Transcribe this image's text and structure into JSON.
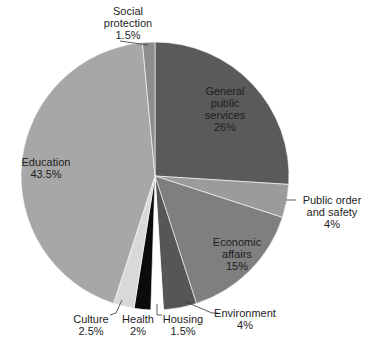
{
  "chart_data": {
    "type": "pie",
    "title": "",
    "start_angle_deg": 0,
    "direction": "clockwise",
    "slices": [
      {
        "label": "General public services",
        "value": 26,
        "display": "26%",
        "color": "#5a5a5a"
      },
      {
        "label": "Public order and safety",
        "value": 4,
        "display": "4%",
        "color": "#9b9b9b"
      },
      {
        "label": "Economic affairs",
        "value": 15,
        "display": "15%",
        "color": "#7f7f7f"
      },
      {
        "label": "Environment",
        "value": 4,
        "display": "4%",
        "color": "#565656"
      },
      {
        "label": "Housing",
        "value": 1.5,
        "display": "1.5%",
        "color": "#ffffff"
      },
      {
        "label": "Health",
        "value": 2,
        "display": "2%",
        "color": "#0b0b0b"
      },
      {
        "label": "Culture",
        "value": 2.5,
        "display": "2.5%",
        "color": "#d9d9d9"
      },
      {
        "label": "Education",
        "value": 43.5,
        "display": "43.5%",
        "color": "#a7a7a7"
      },
      {
        "label": "Social protection",
        "value": 1.5,
        "display": "1.5%",
        "color": "#8d8d8d"
      }
    ]
  },
  "labels": {
    "general": {
      "l1": "General",
      "l2": "public",
      "l3": "services",
      "pct": "26%"
    },
    "public_order": {
      "l1": "Public order",
      "l2": "and safety",
      "pct": "4%"
    },
    "economic": {
      "l1": "Economic",
      "l2": "affairs",
      "pct": "15%"
    },
    "environment": {
      "l1": "Environment",
      "pct": "4%"
    },
    "housing": {
      "l1": "Housing",
      "pct": "1.5%"
    },
    "health": {
      "l1": "Health",
      "pct": "2%"
    },
    "culture": {
      "l1": "Culture",
      "pct": "2.5%"
    },
    "education": {
      "l1": "Education",
      "pct": "43.5%"
    },
    "social": {
      "l1": "Social",
      "l2": "protection",
      "pct": "1.5%"
    }
  }
}
